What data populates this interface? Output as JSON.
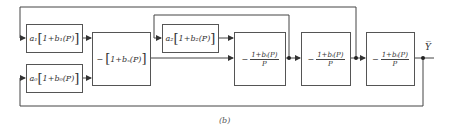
{
  "diagram": {
    "type": "block-diagram",
    "caption": "(b)",
    "blocks": {
      "a1": {
        "gain": "a₁",
        "expr": "1+b₁(P)"
      },
      "a0": {
        "gain": "a₀",
        "expr": "1+b₀(P)"
      },
      "bs": {
        "sign": "−",
        "expr": "1+bₛ(P)"
      },
      "a2": {
        "gain": "a₂",
        "expr": "1+b₂(P)"
      },
      "int1": {
        "sign": "−",
        "numerator": "1+bᵢ(P)",
        "denominator": "P"
      },
      "int2": {
        "sign": "−",
        "numerator": "1+bᵢ(P)",
        "denominator": "P"
      },
      "int3": {
        "sign": "−",
        "numerator": "1+bᵢ(P)",
        "denominator": "P"
      }
    },
    "output_label": "Y̅"
  },
  "colors": {
    "line": "#444444",
    "background": "#ffffff"
  }
}
